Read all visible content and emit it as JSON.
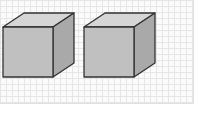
{
  "diagram": {
    "background": {
      "type": "grid",
      "color": "#fbfbfb",
      "line_color": "#e6e6e6"
    },
    "colors": {
      "top": "#d6d6d6",
      "front": "#c0c0c0",
      "side": "#a9a9a9",
      "stroke": "#333333"
    },
    "shapes": [
      {
        "name": "cube-left",
        "front": {
          "x": 3,
          "y": 27,
          "w": 50,
          "h": 50
        },
        "depth_dx": 21,
        "depth_dy": -14
      },
      {
        "name": "cube-right",
        "front": {
          "x": 84,
          "y": 27,
          "w": 50,
          "h": 50
        },
        "depth_dx": 21,
        "depth_dy": -14
      }
    ]
  }
}
